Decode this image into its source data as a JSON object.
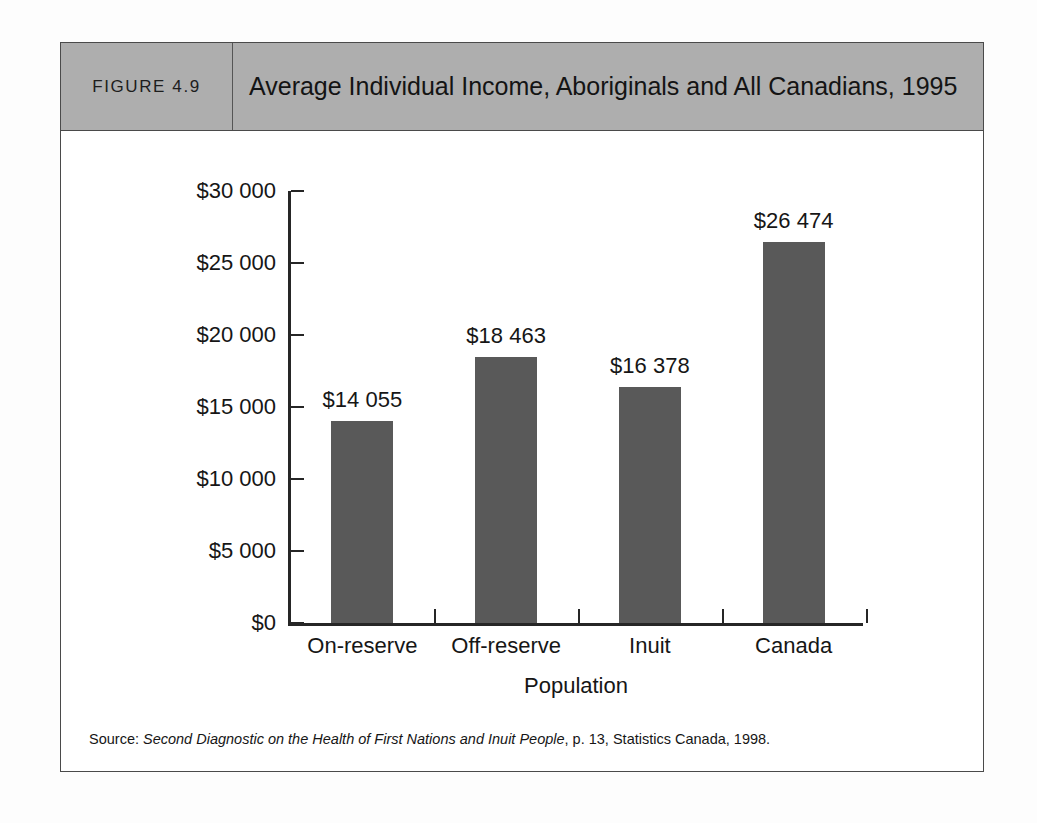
{
  "figure": {
    "number_label": "FIGURE 4.9",
    "title": "Average Individual Income, Aboriginals and All Canadians, 1995",
    "header_bg": "#aeaeae",
    "border_color": "#4a4a4a"
  },
  "source": {
    "prefix": "Source: ",
    "work_title": "Second Diagnostic on the Health of First Nations and Inuit People",
    "suffix": ", p. 13, Statistics Canada, 1998."
  },
  "chart_data": {
    "type": "bar",
    "title": "Average Individual Income, Aboriginals and All Canadians, 1995",
    "categories": [
      "On-reserve",
      "Off-reserve",
      "Inuit",
      "Canada"
    ],
    "values": [
      14055,
      18463,
      16378,
      26474
    ],
    "value_labels": [
      "$14 055",
      "$18 463",
      "$16 378",
      "$26 474"
    ],
    "xlabel": "Population",
    "ylabel": "",
    "ylim": [
      0,
      30000
    ],
    "ytick_values": [
      0,
      5000,
      10000,
      15000,
      20000,
      25000,
      30000
    ],
    "ytick_labels": [
      "$0",
      "$5 000",
      "$10 000",
      "$15 000",
      "$20 000",
      "$25 000",
      "$30 000"
    ],
    "grid": false,
    "legend": false,
    "bar_color": "#595959",
    "axis_color": "#262626"
  }
}
